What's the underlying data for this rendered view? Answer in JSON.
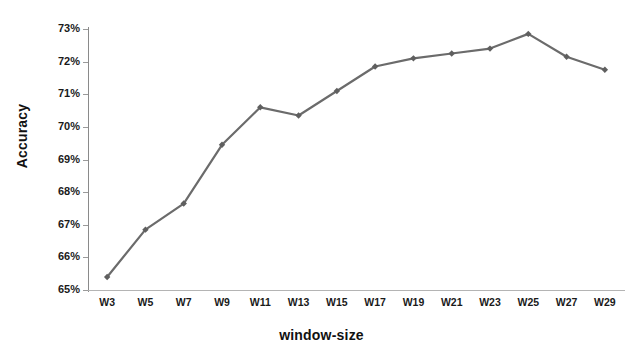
{
  "chart_data": {
    "type": "line",
    "title": "",
    "xlabel": "window-size",
    "ylabel": "Accuracy",
    "categories": [
      "W3",
      "W5",
      "W7",
      "W9",
      "W11",
      "W13",
      "W15",
      "W17",
      "W19",
      "W21",
      "W23",
      "W25",
      "W27",
      "W29"
    ],
    "values": [
      65.4,
      66.85,
      67.65,
      69.45,
      70.6,
      70.35,
      71.1,
      71.85,
      72.1,
      72.25,
      72.4,
      72.85,
      72.15,
      71.75
    ],
    "series": [
      {
        "name": "Accuracy",
        "values": [
          65.4,
          66.85,
          67.65,
          69.45,
          70.6,
          70.35,
          71.1,
          71.85,
          72.1,
          72.25,
          72.4,
          72.85,
          72.15,
          71.75
        ]
      }
    ],
    "ytick_labels": [
      "73%",
      "72%",
      "71%",
      "70%",
      "69%",
      "68%",
      "67%",
      "66%",
      "65%"
    ],
    "ytick_values": [
      73,
      72,
      71,
      70,
      69,
      68,
      67,
      66,
      65
    ],
    "ylim": [
      65,
      73
    ],
    "yunit": "%",
    "grid": false,
    "legend": "none",
    "marker": "diamond",
    "line_color": "#6b6b6b",
    "marker_color": "#5f5f5f",
    "axis_color": "#9a9a9a",
    "background": "#ffffff"
  }
}
